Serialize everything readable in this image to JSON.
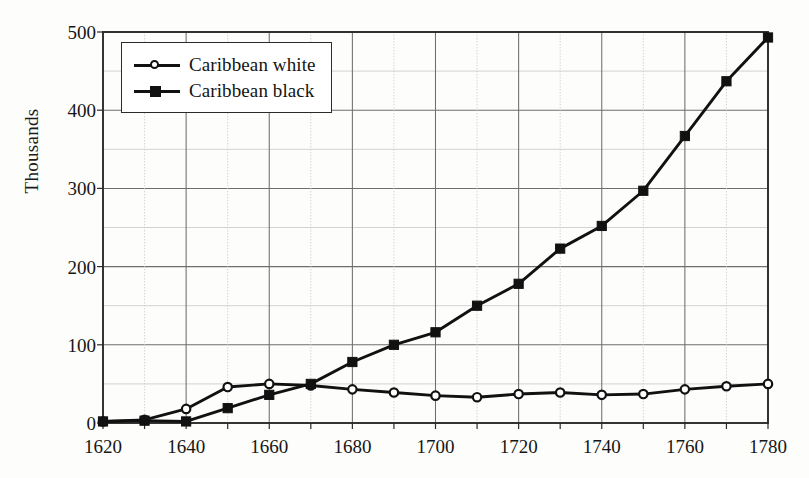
{
  "figure": {
    "background_color": "#fdfdfb",
    "ink_color": "#111111",
    "grid_major_color": "#6e6e6e",
    "grid_minor_color": "#c8c8c8",
    "axis_color": "#2b2b2b"
  },
  "legend": {
    "position": "top-left-inside",
    "entries": [
      {
        "label": "Caribbean white",
        "marker": "open-circle",
        "marker_name": "open-circle-marker-icon"
      },
      {
        "label": "Caribbean black",
        "marker": "filled-square",
        "marker_name": "filled-square-marker-icon"
      }
    ]
  },
  "axes": {
    "y_title": "Thousands",
    "y_ticks": [
      "0",
      "100",
      "200",
      "300",
      "400",
      "500"
    ],
    "x_ticks": [
      "1620",
      "1640",
      "1660",
      "1680",
      "1700",
      "1720",
      "1740",
      "1760",
      "1780"
    ]
  },
  "chart_data": {
    "type": "line",
    "title": "",
    "subtitle": "",
    "xlabel": "",
    "ylabel": "Thousands",
    "xlim": [
      1620,
      1780
    ],
    "ylim": [
      0,
      500
    ],
    "x_tick_interval": 20,
    "x_minor_tick_interval": 10,
    "y_tick_interval": 100,
    "y_minor_gridline_interval": 50,
    "grid": true,
    "legend_position": "upper left",
    "x": [
      1620,
      1630,
      1640,
      1650,
      1660,
      1670,
      1680,
      1690,
      1700,
      1710,
      1720,
      1730,
      1740,
      1750,
      1760,
      1770,
      1780
    ],
    "series": [
      {
        "name": "Caribbean white",
        "marker": "open-circle",
        "values": [
          2,
          4,
          18,
          46,
          50,
          48,
          43,
          39,
          35,
          33,
          37,
          39,
          36,
          37,
          43,
          47,
          50
        ]
      },
      {
        "name": "Caribbean black",
        "marker": "filled-square",
        "values": [
          2,
          3,
          2,
          19,
          36,
          50,
          78,
          100,
          116,
          150,
          178,
          223,
          252,
          297,
          367,
          437,
          493
        ]
      }
    ]
  }
}
